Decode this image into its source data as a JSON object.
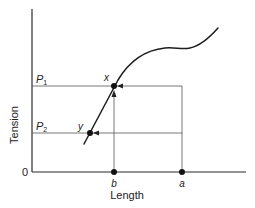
{
  "figure": {
    "y_axis_label": "Tension",
    "x_axis_label": "Length",
    "origin_label": "0",
    "tension_levels": [
      {
        "symbol": "P",
        "subscript": "1"
      },
      {
        "symbol": "P",
        "subscript": "2"
      }
    ],
    "curve_points": [
      {
        "label": "x"
      },
      {
        "label": "y"
      }
    ],
    "length_points": [
      {
        "label": "b"
      },
      {
        "label": "a"
      }
    ]
  }
}
